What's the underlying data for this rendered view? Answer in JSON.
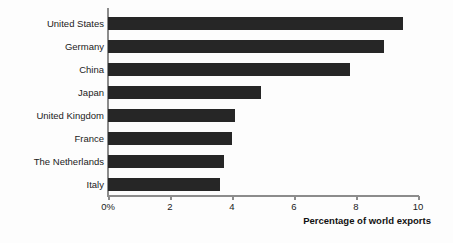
{
  "chart_data": {
    "type": "bar",
    "orientation": "horizontal",
    "title": "",
    "subtitle": "",
    "xlabel": "Percentage of world exports",
    "ylabel": "",
    "categories": [
      "United States",
      "Germany",
      "China",
      "Japan",
      "United Kingdom",
      "France",
      "The Netherlands",
      "Italy"
    ],
    "values": [
      9.5,
      8.9,
      7.8,
      4.95,
      4.1,
      4.0,
      3.75,
      3.6
    ],
    "xlim": [
      0,
      10
    ],
    "xticks": [
      0,
      2,
      4,
      6,
      8,
      10
    ],
    "xtick_labels": [
      "0%",
      "2",
      "4",
      "6",
      "8",
      "10"
    ],
    "grid": false,
    "legend": null,
    "bar_color": "#262626",
    "axis_color": "#8c8c8c",
    "background_color": "#fdfdfd",
    "text_color": "#1b1b1b"
  }
}
